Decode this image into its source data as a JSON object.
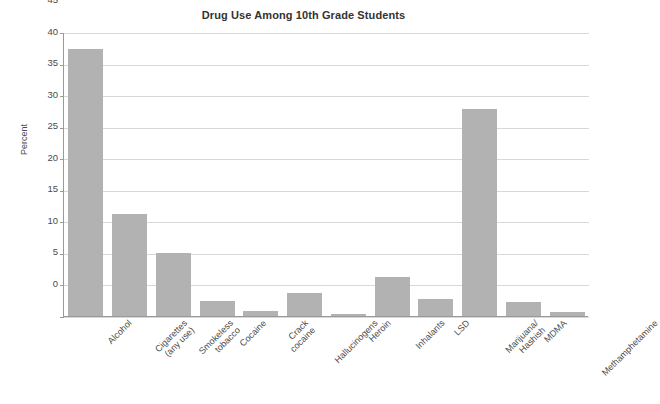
{
  "chart_data": {
    "type": "bar",
    "title": "Drug Use Among 10th Grade Students",
    "xlabel": "",
    "ylabel": "Percent",
    "ylim": [
      0,
      45
    ],
    "yticks": [
      0,
      5,
      10,
      15,
      20,
      25,
      30,
      35,
      40,
      45
    ],
    "grid": true,
    "legend": "none",
    "bar_color": "#b2b2b2",
    "categories": [
      "Alcohol",
      "Cigarettes\n(any use)",
      "Smokeless\ntobacco",
      "Cocaine",
      "Crack\ncocaine",
      "Hallucinogens",
      "Heroin",
      "Inhalants",
      "LSD",
      "Marijuana/\nHashish",
      "MDMA",
      "Methamphetamine"
    ],
    "values": [
      42.3,
      16.1,
      10.0,
      2.4,
      0.8,
      3.7,
      0.3,
      6.2,
      2.7,
      32.8,
      2.2,
      0.6
    ]
  }
}
